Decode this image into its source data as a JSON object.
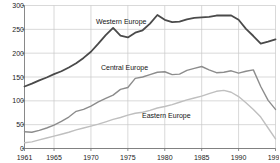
{
  "chart_data": {
    "type": "line",
    "title": "",
    "xlabel": "",
    "ylabel": "",
    "xlim": [
      1961,
      1995
    ],
    "ylim": [
      0,
      300
    ],
    "grid": true,
    "legend_position": "inline-annotations",
    "y_ticks": [
      0,
      50,
      100,
      150,
      200,
      250,
      300
    ],
    "x_ticks": [
      1961,
      1965,
      1970,
      1975,
      1980,
      1985,
      1990,
      1995
    ],
    "x": [
      1961,
      1962,
      1963,
      1964,
      1965,
      1966,
      1967,
      1968,
      1969,
      1970,
      1971,
      1972,
      1973,
      1974,
      1975,
      1976,
      1977,
      1978,
      1979,
      1980,
      1981,
      1982,
      1983,
      1984,
      1985,
      1986,
      1987,
      1988,
      1989,
      1990,
      1991,
      1992,
      1993,
      1994,
      1995
    ],
    "series": [
      {
        "name": "Western Europe",
        "color": "#4a4a4a",
        "label_x": 96,
        "label_y": 18,
        "values": [
          130,
          136,
          143,
          149,
          156,
          162,
          170,
          179,
          190,
          203,
          220,
          238,
          253,
          237,
          233,
          243,
          248,
          262,
          280,
          270,
          265,
          266,
          271,
          274,
          275,
          276,
          279,
          279,
          279,
          270,
          251,
          236,
          220,
          224,
          229
        ]
      },
      {
        "name": "Central Europe",
        "color": "#8c8c8c",
        "label_x": 101,
        "label_y": 64,
        "values": [
          35,
          34,
          38,
          43,
          49,
          57,
          66,
          78,
          82,
          89,
          98,
          105,
          112,
          124,
          128,
          147,
          150,
          155,
          160,
          161,
          155,
          156,
          164,
          168,
          172,
          165,
          159,
          160,
          163,
          158,
          162,
          165,
          130,
          101,
          82
        ]
      },
      {
        "name": "Eastern Europe",
        "color": "#bfbfbf",
        "label_x": 142,
        "label_y": 112,
        "values": [
          12,
          14,
          18,
          22,
          26,
          30,
          34,
          39,
          43,
          47,
          51,
          56,
          61,
          65,
          70,
          74,
          76,
          80,
          85,
          88,
          92,
          97,
          102,
          106,
          110,
          115,
          120,
          122,
          118,
          109,
          96,
          82,
          66,
          43,
          20
        ]
      }
    ]
  }
}
